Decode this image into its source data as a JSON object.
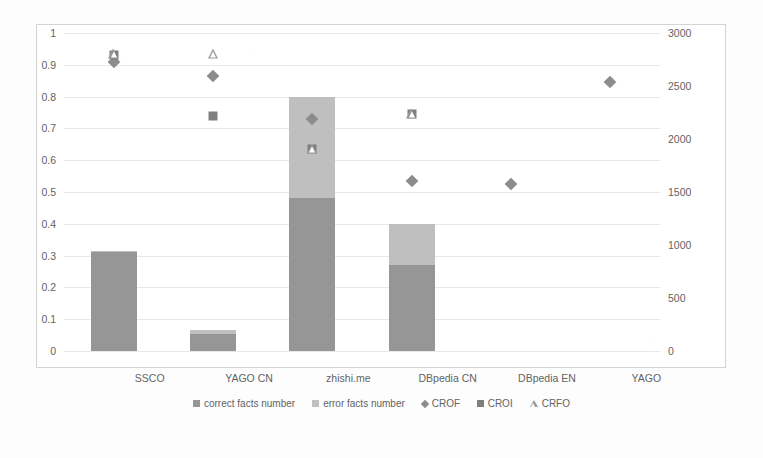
{
  "chart_data": {
    "type": "bar",
    "title": "",
    "subtitle": "",
    "xlabel": "",
    "ylabel": "",
    "categories": [
      "SSCO",
      "YAGO CN",
      "zhishi.me",
      "DBpedia CN",
      "DBpedia EN",
      "YAGO"
    ],
    "axes": {
      "left": {
        "label": "",
        "min": 0,
        "max": 1,
        "step": 0.1,
        "ticks": [
          "0",
          "0.1",
          "0.2",
          "0.3",
          "0.4",
          "0.5",
          "0.6",
          "0.7",
          "0.8",
          "0.9",
          "1"
        ],
        "tick_values": [
          0,
          0.1,
          0.2,
          0.3,
          0.4,
          0.5,
          0.6,
          0.7,
          0.8,
          0.9,
          1
        ]
      },
      "right": {
        "label": "",
        "min": 0,
        "max": 3000,
        "step": 500,
        "ticks": [
          "0",
          "500",
          "1000",
          "1500",
          "2000",
          "2500",
          "3000"
        ],
        "tick_values": [
          0,
          500,
          1000,
          1500,
          2000,
          2500,
          3000
        ]
      }
    },
    "grid": true,
    "legend_position": "bottom",
    "stacked": true,
    "series": [
      {
        "name": "correct facts number",
        "kind": "bar",
        "axis": "right",
        "color": "#969696",
        "marker": "square-swatch",
        "values_fraction": [
          0.31,
          0.055,
          0.48,
          0.27,
          null,
          null
        ],
        "values": [
          930,
          165,
          1440,
          810,
          null,
          null
        ]
      },
      {
        "name": "error facts number",
        "kind": "bar",
        "axis": "right",
        "color": "#bfbfbf",
        "marker": "square-swatch",
        "values_fraction": [
          0.005,
          0.01,
          0.32,
          0.13,
          null,
          null
        ],
        "values": [
          15,
          30,
          960,
          390,
          null,
          null
        ]
      },
      {
        "name": "CROF",
        "kind": "scatter",
        "axis": "left",
        "color": "#8c8c8c",
        "marker": "diamond",
        "values": [
          0.91,
          0.865,
          0.73,
          0.535,
          0.525,
          0.845
        ]
      },
      {
        "name": "CROI",
        "kind": "scatter",
        "axis": "left",
        "color": "#7f7f7f",
        "marker": "square",
        "values": [
          0.93,
          0.74,
          0.635,
          0.745,
          null,
          null
        ]
      },
      {
        "name": "CRFO",
        "kind": "scatter",
        "axis": "left",
        "color": "#9a9a9a",
        "marker": "triangle",
        "values": [
          0.935,
          0.935,
          0.635,
          0.745,
          null,
          null
        ]
      }
    ],
    "bar_totals_fraction": [
      0.315,
      0.065,
      0.8,
      0.4,
      null,
      null
    ],
    "bar_totals": [
      945,
      195,
      2400,
      1200,
      null,
      null
    ]
  },
  "legend": {
    "items": [
      {
        "label": "correct facts number",
        "icon": "square-swatch-dark-icon"
      },
      {
        "label": "error facts number",
        "icon": "square-swatch-light-icon"
      },
      {
        "label": "CROF",
        "icon": "diamond-marker-icon"
      },
      {
        "label": "CROI",
        "icon": "square-marker-icon"
      },
      {
        "label": "CRFO",
        "icon": "triangle-marker-icon"
      }
    ]
  }
}
